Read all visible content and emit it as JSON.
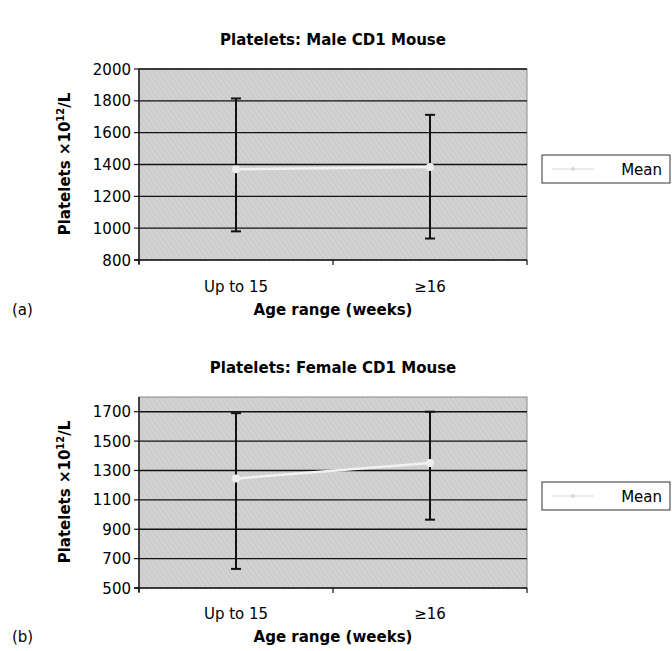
{
  "chart_data": [
    {
      "panel_label": "(a)",
      "type": "line",
      "title": "Platelets: Male CD1 Mouse",
      "xlabel": "Age range (weeks)",
      "ylabel_main": "Platelets ×10",
      "ylabel_sup": "12",
      "ylabel_tail": "/L",
      "categories": [
        "Up to 15",
        "≥16"
      ],
      "ylim": [
        800,
        2000
      ],
      "yticks": [
        800,
        1000,
        1200,
        1400,
        1600,
        1800,
        2000
      ],
      "grid": true,
      "legend": {
        "position": "right",
        "entries": [
          "Mean"
        ]
      },
      "series": [
        {
          "name": "Mean",
          "values": [
            1370,
            1385
          ],
          "error_low": [
            980,
            935
          ],
          "error_high": [
            1815,
            1712
          ]
        }
      ]
    },
    {
      "panel_label": "(b)",
      "type": "line",
      "title": "Platelets: Female CD1 Mouse",
      "xlabel": "Age range (weeks)",
      "ylabel_main": "Platelets ×10",
      "ylabel_sup": "12",
      "ylabel_tail": "/L",
      "categories": [
        "Up to 15",
        "≥16"
      ],
      "ylim": [
        500,
        1800
      ],
      "yticks": [
        500,
        700,
        900,
        1100,
        1300,
        1500,
        1700
      ],
      "grid": true,
      "legend": {
        "position": "right",
        "entries": [
          "Mean"
        ]
      },
      "series": [
        {
          "name": "Mean",
          "values": [
            1245,
            1350
          ],
          "error_low": [
            630,
            965
          ],
          "error_high": [
            1690,
            1700
          ]
        }
      ]
    }
  ]
}
